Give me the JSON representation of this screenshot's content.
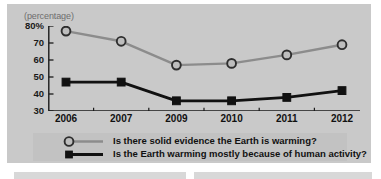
{
  "figure": {
    "unit_label": "(percentage)",
    "background_color": "#c9c9c9",
    "legend_background_color": "#c2c2c2"
  },
  "legend": {
    "items": [
      {
        "label": "Is there solid evidence the Earth is warming?",
        "marker": "circle-marker-icon",
        "color": "#8c8c8c"
      },
      {
        "label": "Is the Earth warming mostly because of human activity?",
        "marker": "square-marker-icon",
        "color": "#111111"
      }
    ]
  },
  "chart_data": {
    "type": "line",
    "title": "",
    "subtitle": "",
    "xlabel": "",
    "ylabel": "(percentage)",
    "categories": [
      "2006",
      "2007",
      "2009",
      "2010",
      "2011",
      "2012"
    ],
    "ylim": [
      30,
      80
    ],
    "yticks": [
      80,
      70,
      60,
      50,
      40,
      30
    ],
    "ytick_labels": [
      "80%",
      "70",
      "60",
      "50",
      "40",
      "30"
    ],
    "grid": false,
    "legend_position": "bottom",
    "series": [
      {
        "name": "Is there solid evidence the Earth is warming?",
        "marker": "circle",
        "color": "#8c8c8c",
        "values": [
          77,
          71,
          57,
          58,
          63,
          69
        ]
      },
      {
        "name": "Is the Earth warming mostly because of human activity?",
        "marker": "square",
        "color": "#111111",
        "values": [
          47,
          47,
          36,
          36,
          38,
          42
        ]
      }
    ]
  }
}
